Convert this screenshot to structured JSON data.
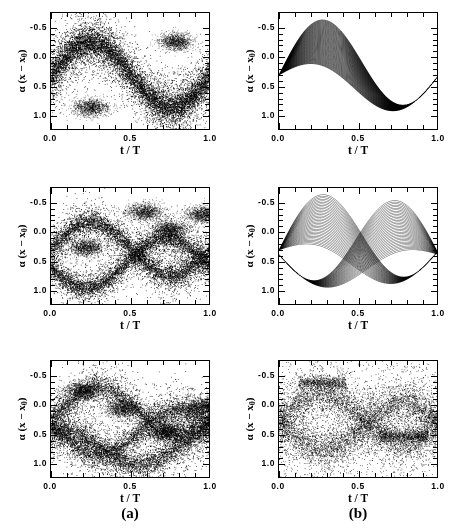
{
  "figure": {
    "width": 453,
    "height": 531,
    "background": "#ffffff",
    "ink": "#000000",
    "columns": [
      {
        "id": "a",
        "label": "(a)",
        "center_x": 130,
        "y": 505
      },
      {
        "id": "b",
        "label": "(b)",
        "center_x": 358,
        "y": 505
      }
    ]
  },
  "axes": {
    "x_title": "t / T",
    "y_title_prefix": "α (x − x",
    "y_title_sub": "0",
    "y_title_suffix": ")",
    "y_title_full": "α (x − x₀)",
    "x_ticklabels": [
      "0.0",
      "0.5",
      "1.0"
    ],
    "x_tickvalues": [
      0.0,
      0.5,
      1.0
    ],
    "y_ticklabels": [
      "-0.5",
      "0.0",
      "0.5",
      "1.0"
    ],
    "y_tickvalues": [
      -0.5,
      0.0,
      0.5,
      1.0
    ],
    "xlim": [
      0.0,
      1.0
    ],
    "ylim": [
      -0.75,
      1.25
    ],
    "y_inverted": true,
    "minor_ticks_per_interval": 5,
    "grid": false
  },
  "chart_data": [
    {
      "id": "a1",
      "type": "scatter",
      "panel": "a-top",
      "row": 1,
      "column": "a",
      "title": "",
      "xlabel": "t / T",
      "ylabel": "α (x − x₀)",
      "xlim": [
        0.0,
        1.0
      ],
      "ylim": [
        -0.75,
        1.25
      ],
      "y_inverted": true,
      "grid": false,
      "description": "Broad noisy scatter cloud tracing a single sinusoidal band; dense dark core near y=-0.25 for t/T in 0.65-0.95",
      "n_points": 9000,
      "point_color": "#000000",
      "point_size": 0.75,
      "bands": [
        {
          "amplitude": 0.55,
          "offset": 0.3,
          "phase": 0.25,
          "spread": 0.3,
          "weight": 1.0
        }
      ],
      "markers": [
        {
          "t": 0.25,
          "y": 0.85,
          "note": "lower turning point"
        },
        {
          "t": 0.78,
          "y": -0.27,
          "note": "upper dense core"
        }
      ]
    },
    {
      "id": "b1",
      "type": "line",
      "panel": "b-top",
      "row": 1,
      "column": "b",
      "title": "",
      "xlabel": "t / T",
      "ylabel": "α (x − x₀)",
      "xlim": [
        0.0,
        1.0
      ],
      "ylim": [
        -0.75,
        1.25
      ],
      "y_inverted": true,
      "grid": false,
      "description": "Dense bundle of deterministic trajectories forming one sinusoidal band with a caustic pinch near t/T = 0.78",
      "n_trajectories": 90,
      "line_color": "#000000",
      "line_width": 0.35,
      "bands": [
        {
          "amplitude": 0.55,
          "offset": 0.3,
          "phase": 0.25,
          "spread": 0.3,
          "weight": 1.0
        }
      ],
      "caustics": [
        {
          "t": 0.78,
          "y": -0.38
        }
      ]
    },
    {
      "id": "a2",
      "type": "scatter",
      "panel": "a-middle",
      "row": 2,
      "column": "a",
      "title": "",
      "xlabel": "t / T",
      "ylabel": "α (x − x₀)",
      "xlim": [
        0.0,
        1.0
      ],
      "ylim": [
        -0.75,
        1.25
      ],
      "y_inverted": true,
      "grid": false,
      "description": "Two interleaved noisy sinusoidal bands producing multiple dark lobes; splitting visible after t/T = 0.5",
      "n_points": 9000,
      "point_color": "#000000",
      "point_size": 0.75,
      "bands": [
        {
          "amplitude": 0.45,
          "offset": 0.28,
          "phase": 0.25,
          "spread": 0.22,
          "weight": 0.5
        },
        {
          "amplitude": 0.42,
          "offset": 0.52,
          "phase": 0.72,
          "spread": 0.22,
          "weight": 0.5
        }
      ],
      "markers": [
        {
          "t": 0.22,
          "y": 0.26,
          "note": "dark lobe"
        },
        {
          "t": 0.58,
          "y": -0.35,
          "note": "dark lobe"
        },
        {
          "t": 0.74,
          "y": -0.05,
          "note": "dark lobe"
        },
        {
          "t": 0.95,
          "y": -0.3,
          "note": "dark lobe"
        }
      ]
    },
    {
      "id": "b2",
      "type": "line",
      "panel": "b-middle",
      "row": 2,
      "column": "b",
      "title": "",
      "xlabel": "t / T",
      "ylabel": "α (x − x₀)",
      "xlim": [
        0.0,
        1.0
      ],
      "ylim": [
        -0.75,
        1.25
      ],
      "y_inverted": true,
      "grid": false,
      "description": "Two crossing trajectory bundles forming a lens/bowtie pattern with caustic crossings near t/T = 0.25 and t/T = 0.66",
      "n_trajectories": 70,
      "line_color": "#000000",
      "line_width": 0.35,
      "bands": [
        {
          "amplitude": 0.5,
          "offset": 0.3,
          "phase": 0.25,
          "spread": 0.34,
          "weight": 0.5
        },
        {
          "amplitude": 0.48,
          "offset": 0.38,
          "phase": 0.75,
          "spread": 0.34,
          "weight": 0.5
        }
      ],
      "caustics": [
        {
          "t": 0.25,
          "y": 0.26
        },
        {
          "t": 0.66,
          "y": -0.22
        }
      ]
    },
    {
      "id": "a3",
      "type": "scatter",
      "panel": "a-bottom",
      "row": 3,
      "column": "a",
      "title": "",
      "xlabel": "t / T",
      "ylabel": "α (x − x₀)",
      "xlim": [
        0.0,
        1.0
      ],
      "ylim": [
        -0.75,
        1.25
      ],
      "y_inverted": true,
      "grid": false,
      "description": "Criss-crossing diagonal noisy bands filling most of the frame; strongest density in the upper half with an X-crossing near t/T = 0.45",
      "n_points": 10000,
      "point_color": "#000000",
      "point_size": 0.75,
      "bands": [
        {
          "amplitude": 0.4,
          "offset": 0.1,
          "phase": 0.3,
          "spread": 0.26,
          "weight": 0.34
        },
        {
          "amplitude": 0.38,
          "offset": 0.45,
          "phase": 0.8,
          "spread": 0.26,
          "weight": 0.33
        },
        {
          "amplitude": 0.3,
          "offset": 0.7,
          "phase": 0.05,
          "spread": 0.26,
          "weight": 0.33
        }
      ],
      "markers": [
        {
          "t": 0.2,
          "y": -0.25,
          "note": "dark lobe"
        },
        {
          "t": 0.45,
          "y": 0.05,
          "note": "X crossing"
        },
        {
          "t": 0.72,
          "y": 0.45,
          "note": "dark lobe"
        },
        {
          "t": 0.95,
          "y": 0.02,
          "note": "dark lobe"
        }
      ]
    },
    {
      "id": "b3",
      "type": "scatter",
      "panel": "b-bottom",
      "row": 3,
      "column": "b",
      "title": "",
      "xlabel": "t / T",
      "ylabel": "α (x − x₀)",
      "xlim": [
        0.0,
        1.0
      ],
      "ylim": [
        -0.75,
        1.25
      ],
      "y_inverted": true,
      "grid": false,
      "description": "Sparse uniform scatter bounded by sharp dark caustic envelope curves crossing near t/T = 0.27 and t/T = 0.78",
      "n_points": 7000,
      "point_color": "#000000",
      "point_size": 0.7,
      "bands": [
        {
          "amplitude": 0.42,
          "offset": 0.22,
          "phase": 0.27,
          "spread": 0.42,
          "weight": 0.5
        },
        {
          "amplitude": 0.4,
          "offset": 0.35,
          "phase": 0.78,
          "spread": 0.42,
          "weight": 0.5
        }
      ],
      "caustics": [
        {
          "t": 0.27,
          "y": -0.38
        },
        {
          "t": 0.78,
          "y": 0.52
        }
      ]
    }
  ],
  "layout": {
    "panels": [
      {
        "id": "a1",
        "left": 50,
        "top": 12,
        "width": 160,
        "height": 118
      },
      {
        "id": "b1",
        "left": 278,
        "top": 12,
        "width": 160,
        "height": 118
      },
      {
        "id": "a2",
        "left": 50,
        "top": 187,
        "width": 160,
        "height": 118
      },
      {
        "id": "b2",
        "left": 278,
        "top": 187,
        "width": 160,
        "height": 118
      },
      {
        "id": "a3",
        "left": 50,
        "top": 360,
        "width": 160,
        "height": 118
      },
      {
        "id": "b3",
        "left": 278,
        "top": 360,
        "width": 160,
        "height": 118
      }
    ]
  }
}
